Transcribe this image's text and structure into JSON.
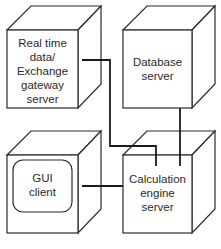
{
  "diagram": {
    "nodes": [
      {
        "id": "realtime",
        "lines": [
          "Real time",
          "data/",
          "Exchange",
          "gateway",
          "server"
        ],
        "shape": "cube"
      },
      {
        "id": "database",
        "lines": [
          "Database",
          "server"
        ],
        "shape": "cube"
      },
      {
        "id": "gui",
        "lines": [
          "GUI",
          "client"
        ],
        "shape": "cube-monitor"
      },
      {
        "id": "calc",
        "lines": [
          "Calculation",
          "engine",
          "server"
        ],
        "shape": "cube"
      }
    ],
    "edges": [
      {
        "from": "realtime",
        "to": "calc"
      },
      {
        "from": "database",
        "to": "calc"
      },
      {
        "from": "gui",
        "to": "calc"
      }
    ],
    "colors": {
      "stroke": "#2a2a2a",
      "background": "#ffffff"
    }
  }
}
